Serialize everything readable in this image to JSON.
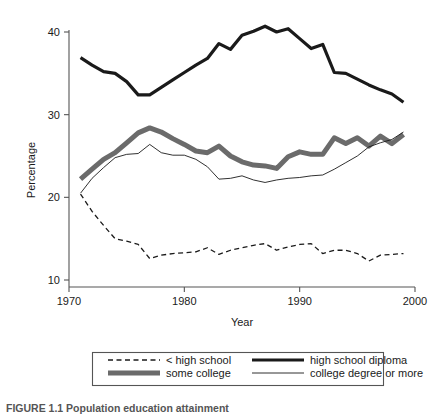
{
  "figure": {
    "caption": "FIGURE 1.1  Population education attainment"
  },
  "chart_data": {
    "type": "line",
    "title": "",
    "xlabel": "Year",
    "ylabel": "Percentage",
    "xlim": [
      1970,
      2000
    ],
    "ylim": [
      10,
      42
    ],
    "xticks": [
      1970,
      1980,
      1990,
      2000
    ],
    "yticks": [
      10,
      20,
      30,
      40
    ],
    "grid": false,
    "legend_position": "below-axes",
    "x": [
      1971,
      1972,
      1973,
      1974,
      1975,
      1976,
      1977,
      1978,
      1979,
      1980,
      1981,
      1982,
      1983,
      1984,
      1985,
      1986,
      1987,
      1988,
      1989,
      1990,
      1991,
      1992,
      1993,
      1994,
      1995,
      1996,
      1997,
      1998,
      1999
    ],
    "series": [
      {
        "name": "< high school",
        "style": "dashed",
        "color": "#1a1a1a",
        "width": 1.3,
        "values": [
          20.4,
          18.3,
          16.6,
          15.0,
          14.7,
          14.3,
          12.6,
          13.0,
          13.2,
          13.3,
          13.4,
          13.9,
          13.1,
          13.6,
          13.9,
          14.2,
          14.4,
          13.6,
          14.0,
          14.3,
          14.4,
          13.2,
          13.6,
          13.6,
          13.2,
          12.3,
          13.0,
          13.1,
          13.2
        ]
      },
      {
        "name": "high school diploma",
        "style": "solid",
        "color": "#1a1a1a",
        "width": 3.2,
        "values": [
          36.9,
          36.0,
          35.2,
          35.0,
          34.0,
          32.4,
          32.4,
          33.3,
          34.2,
          35.1,
          36.0,
          36.8,
          38.6,
          37.9,
          39.6,
          40.1,
          40.7,
          40.0,
          40.4,
          39.2,
          38.0,
          38.5,
          35.1,
          35.0,
          34.3,
          33.6,
          33.0,
          32.5,
          31.5
        ]
      },
      {
        "name": "some college",
        "style": "solid",
        "color": "#6b6b6b",
        "width": 5.0,
        "values": [
          22.2,
          23.4,
          24.6,
          25.4,
          26.6,
          27.8,
          28.4,
          27.9,
          27.1,
          26.4,
          25.6,
          25.4,
          26.2,
          25.0,
          24.3,
          23.9,
          23.8,
          23.5,
          24.9,
          25.5,
          25.2,
          25.2,
          27.2,
          26.5,
          27.2,
          26.2,
          27.4,
          26.5,
          27.6
        ]
      },
      {
        "name": "college degree or more",
        "style": "solid",
        "color": "#1a1a1a",
        "width": 0.9,
        "values": [
          20.5,
          22.3,
          23.6,
          24.8,
          25.2,
          25.3,
          26.4,
          25.4,
          25.1,
          25.1,
          24.6,
          23.7,
          22.2,
          22.3,
          22.6,
          22.1,
          21.8,
          22.1,
          22.3,
          22.4,
          22.6,
          22.7,
          23.4,
          24.2,
          25.0,
          26.1,
          26.6,
          27.0,
          27.9
        ]
      }
    ]
  },
  "legend": {
    "items": [
      {
        "label": "< high school",
        "swatch": "dashed-line-swatch"
      },
      {
        "label": "high school diploma",
        "swatch": "thick-black-line-swatch"
      },
      {
        "label": "some college",
        "swatch": "thick-gray-line-swatch"
      },
      {
        "label": "college degree or more",
        "swatch": "thin-black-line-swatch"
      }
    ]
  }
}
